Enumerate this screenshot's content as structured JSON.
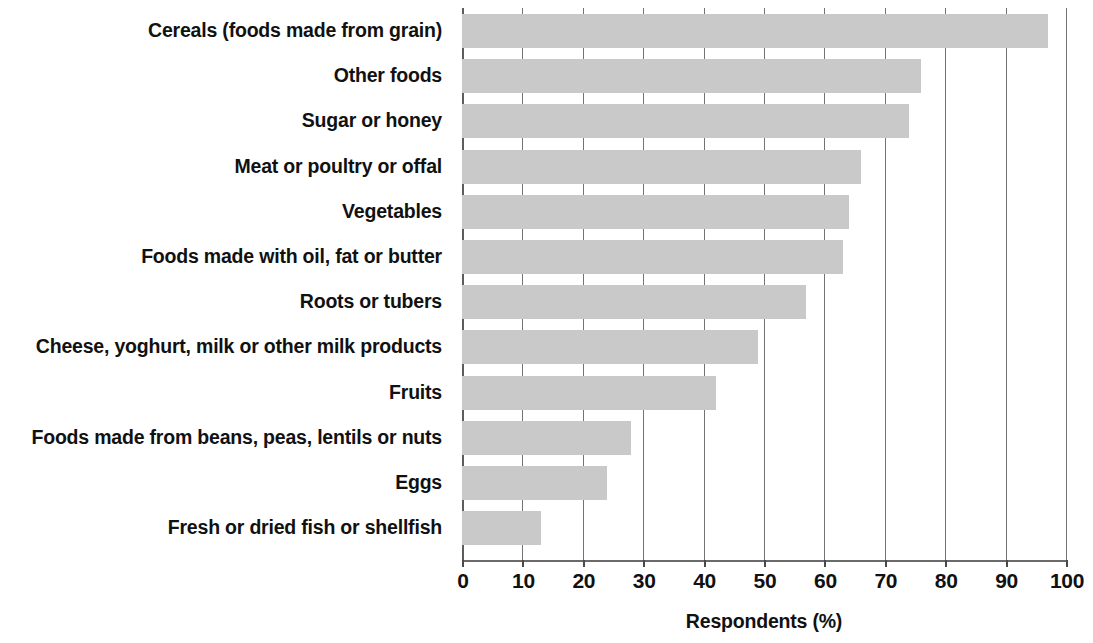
{
  "chart_data": {
    "type": "bar",
    "orientation": "horizontal",
    "title": "",
    "subtitle": "",
    "xlabel": "Respondents (%)",
    "ylabel": "",
    "xlim": [
      0,
      100
    ],
    "xticks": [
      0,
      10,
      20,
      30,
      40,
      50,
      60,
      70,
      80,
      90,
      100
    ],
    "xtick_labels": [
      "0",
      "10",
      "20",
      "30",
      "40",
      "50",
      "60",
      "70",
      "80",
      "90",
      "100"
    ],
    "grid": "vertical",
    "legend": "none",
    "categories": [
      "Cereals (foods made from grain)",
      "Other foods",
      "Sugar or honey",
      "Meat or poultry or offal",
      "Vegetables",
      "Foods made with oil, fat or butter",
      "Roots or tubers",
      "Cheese, yoghurt, milk or other milk products",
      "Fruits",
      "Foods made from beans, peas, lentils or nuts",
      "Eggs",
      "Fresh or dried fish or shellfish"
    ],
    "values": [
      97,
      76,
      74,
      66,
      64,
      63,
      57,
      49,
      42,
      28,
      24,
      13
    ],
    "bar_color": "#c9c9c9",
    "axis_color": "#6a6a6a",
    "text_color": "#111111"
  }
}
